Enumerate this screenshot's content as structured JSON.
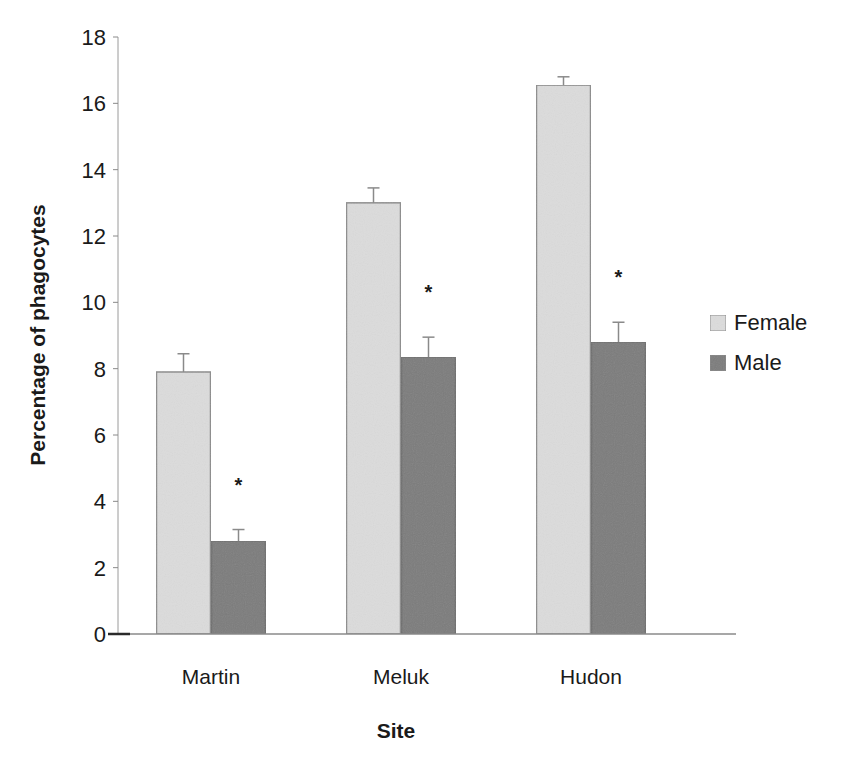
{
  "chart_data": {
    "type": "bar",
    "title": "",
    "xlabel": "Site",
    "ylabel": "Percentage of phagocytes",
    "categories": [
      "Martin",
      "Meluk",
      "Hudon"
    ],
    "series": [
      {
        "name": "Female",
        "values": [
          7.9,
          13.0,
          16.55
        ],
        "errors": [
          0.55,
          0.45,
          0.25
        ],
        "color": "#dcdcdc",
        "border": "#8c8c8c"
      },
      {
        "name": "Male",
        "values": [
          2.8,
          8.35,
          8.8
        ],
        "errors": [
          0.35,
          0.6,
          0.6
        ],
        "color": "#7b7b7b",
        "border": "#6e6e6e"
      }
    ],
    "significance_markers": [
      {
        "category": "Martin",
        "series": "Male",
        "label": "*"
      },
      {
        "category": "Meluk",
        "series": "Male",
        "label": "*"
      },
      {
        "category": "Hudon",
        "series": "Male",
        "label": "*"
      }
    ],
    "ylim": [
      0,
      18
    ],
    "yticks": [
      0,
      2,
      4,
      6,
      8,
      10,
      12,
      14,
      16,
      18
    ],
    "grid": false,
    "legend_position": "right"
  },
  "legend": {
    "items": [
      {
        "label": "Female",
        "color": "#dcdcdc"
      },
      {
        "label": "Male",
        "color": "#7b7b7b"
      }
    ]
  },
  "axes": {
    "x_title": "Site",
    "y_title": "Percentage of phagocytes"
  }
}
